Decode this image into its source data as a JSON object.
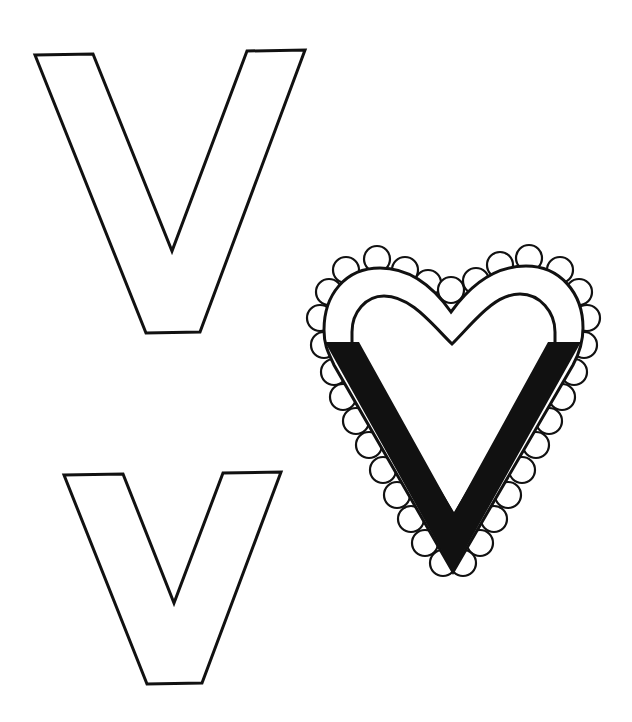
{
  "page": {
    "title": "Letter V coloring page",
    "colors": {
      "ink": "#111111",
      "paper": "#ffffff"
    }
  },
  "letters": [
    {
      "id": "uppercase",
      "glyph": "V",
      "style": "outline"
    },
    {
      "id": "lowercase",
      "glyph": "v",
      "style": "outline"
    }
  ],
  "illustration": {
    "subject": "valentine heart",
    "label": "V is for Valentine heart",
    "details": "scalloped lace border with a black V band"
  }
}
